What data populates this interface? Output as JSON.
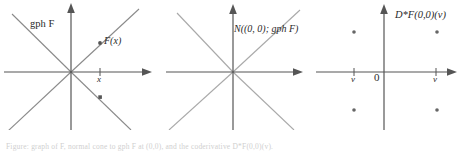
{
  "figure": {
    "panels": [
      {
        "id": "panel-gph-F",
        "graph_label": "gph F",
        "point_label": "F(x)",
        "axis_tick_label": "x",
        "axis_color": "#555555",
        "line_color": "#8a8a8a",
        "marker_color": "#555555",
        "markers": [
          "round-dot-upper-right",
          "square-dot-lower-right"
        ],
        "lines": [
          "diagonal-up-right",
          "diagonal-down-right",
          "vertical-axis",
          "horizontal-axis"
        ]
      },
      {
        "id": "panel-normal-cone",
        "graph_label": "N((0, 0); gph F)",
        "axis_color": "#555555",
        "line_color": "#a9a9a9",
        "lines": [
          "diagonal-up-right",
          "diagonal-down-right",
          "vertical-axis",
          "horizontal-axis"
        ]
      },
      {
        "id": "panel-coderivative",
        "graph_label": "D*F(0,0)(v)",
        "origin_label": "0",
        "tick_label_left": "v",
        "tick_label_right": "v",
        "axis_color": "#555555",
        "marker_color": "#666666",
        "markers": [
          "dot-upper-left",
          "dot-upper-right",
          "dot-lower-left",
          "dot-lower-right"
        ]
      }
    ],
    "caption": "Figure: graph of F, normal cone to gph F at (0,0), and the coderivative D*F(0,0)(v)."
  },
  "colors": {
    "background": "#ffffff",
    "axis": "#555555",
    "graph_line": "#8a8a8a",
    "cone_line": "#a9a9a9",
    "text": "#2a2a2a",
    "caption": "#cfcfcf"
  }
}
